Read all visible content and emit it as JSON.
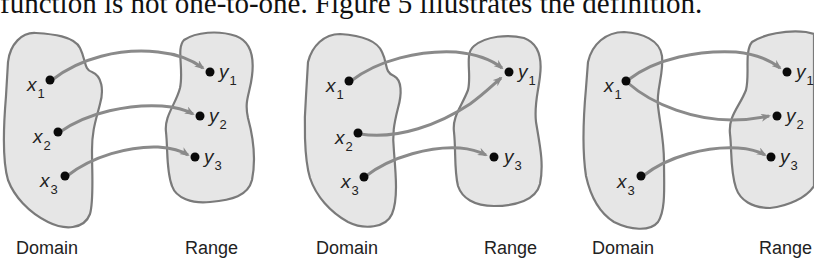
{
  "caption": "function is not one-to-one. Figure 5 illustrates the definition.",
  "colors": {
    "blob_fill": "#e6e6e6",
    "blob_stroke": "#7a7a7a",
    "arrow": "#8a8a8a",
    "dot": "#0a0a0a"
  },
  "panels": [
    {
      "domain_label": "Domain",
      "range_label": "Range",
      "domain_points": [
        {
          "var": "x",
          "sub": "1"
        },
        {
          "var": "x",
          "sub": "2"
        },
        {
          "var": "x",
          "sub": "3"
        }
      ],
      "range_points": [
        {
          "var": "y",
          "sub": "1"
        },
        {
          "var": "y",
          "sub": "2"
        },
        {
          "var": "y",
          "sub": "3"
        }
      ],
      "mappings": [
        [
          "x1",
          "y1"
        ],
        [
          "x2",
          "y2"
        ],
        [
          "x3",
          "y3"
        ]
      ]
    },
    {
      "domain_label": "Domain",
      "range_label": "Range",
      "domain_points": [
        {
          "var": "x",
          "sub": "1"
        },
        {
          "var": "x",
          "sub": "2"
        },
        {
          "var": "x",
          "sub": "3"
        }
      ],
      "range_points": [
        {
          "var": "y",
          "sub": "1"
        },
        {
          "var": "y",
          "sub": "3"
        }
      ],
      "mappings": [
        [
          "x1",
          "y1"
        ],
        [
          "x2",
          "y1"
        ],
        [
          "x3",
          "y3"
        ]
      ]
    },
    {
      "domain_label": "Domain",
      "range_label": "Range",
      "domain_points": [
        {
          "var": "x",
          "sub": "1"
        },
        {
          "var": "x",
          "sub": "3"
        }
      ],
      "range_points": [
        {
          "var": "y",
          "sub": "1"
        },
        {
          "var": "y",
          "sub": "2"
        },
        {
          "var": "y",
          "sub": "3"
        }
      ],
      "mappings": [
        [
          "x1",
          "y1"
        ],
        [
          "x1",
          "y2"
        ],
        [
          "x3",
          "y3"
        ]
      ]
    }
  ]
}
